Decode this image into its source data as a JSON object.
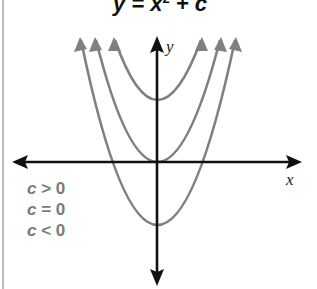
{
  "title": {
    "lhs": "y = x",
    "exponent": "2",
    "rhs": " + c"
  },
  "axes": {
    "x_label": "x",
    "y_label": "y",
    "color": "#111111"
  },
  "legend": [
    {
      "var": "c",
      "text": " > 0"
    },
    {
      "var": "c",
      "text": " = 0"
    },
    {
      "var": "c",
      "text": " < 0"
    }
  ],
  "curves": {
    "color": "#808080",
    "items": [
      {
        "name": "c > 0",
        "vertex_offset": "above origin"
      },
      {
        "name": "c = 0",
        "vertex_offset": "at origin"
      },
      {
        "name": "c < 0",
        "vertex_offset": "below origin"
      }
    ]
  }
}
